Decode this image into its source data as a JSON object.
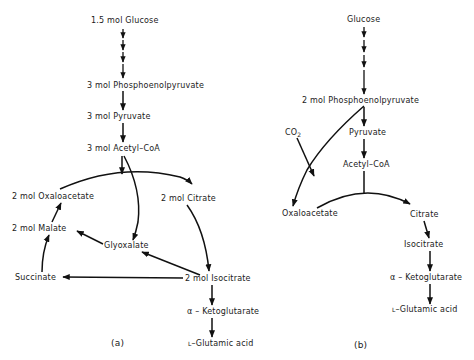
{
  "panel_a": {
    "caption": "(a)",
    "nodes": {
      "glucose": "1.5 mol  Glucose",
      "pep": "3 mol  Phosphoenolpyruvate",
      "pyruvate": "3 mol  Pyruvate",
      "acetylcoa": "3 mol  Acetyl–CoA",
      "oxaloacetate": "2 mol  Oxaloacetate",
      "citrate": "2 mol  Citrate",
      "malate": "2 mol  Malate",
      "glyoxalate": "Glyoxalate",
      "succinate": "Succinate",
      "isocitrate": "2 mol  Isocitrate",
      "ketoglutarate": "α – Ketoglutarate",
      "glutamic_prefix": "L",
      "glutamic": "–Glutamic acid"
    }
  },
  "panel_b": {
    "caption": "(b)",
    "nodes": {
      "glucose": "Glucose",
      "pep": "2 mol  Phosphoenolpyruvate",
      "co2": "CO",
      "co2_sub": "2",
      "pyruvate": "Pyruvate",
      "acetylcoa": "Acetyl–CoA",
      "oxaloacetate": "Oxaloacetate",
      "citrate": "Citrate",
      "isocitrate": "Isocitrate",
      "ketoglutarate": "α – Ketoglutarate",
      "glutamic_prefix": "L",
      "glutamic": "–Glutamic acid"
    }
  }
}
